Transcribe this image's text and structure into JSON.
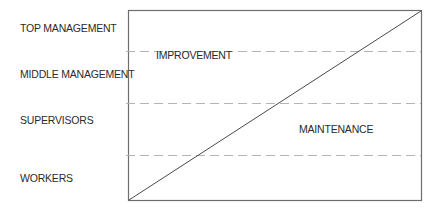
{
  "diagram": {
    "levels": [
      {
        "label": "TOP MANAGEMENT"
      },
      {
        "label": "MIDDLE MANAGEMENT"
      },
      {
        "label": "SUPERVISORS"
      },
      {
        "label": "WORKERS"
      }
    ],
    "regions": {
      "upper": "IMPROVEMENT",
      "lower": "MAINTENANCE"
    },
    "colors": {
      "frame": "#6e6e6e",
      "diagonal": "#4a4a4a",
      "dashed": "#b4b4b4",
      "text": "#2b2b2b"
    }
  }
}
